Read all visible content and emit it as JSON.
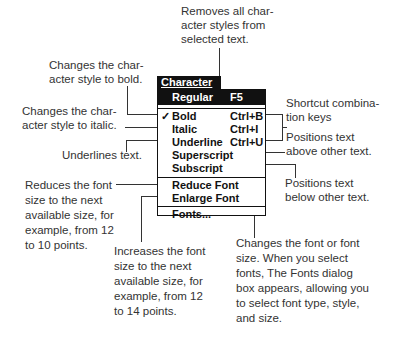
{
  "menu": {
    "title": "Character",
    "title_mnemonic": "C",
    "selected": {
      "label": "Regular",
      "shortcut": "F5"
    },
    "items": [
      {
        "label": "Bold",
        "mnemonic": "B",
        "shortcut": "Ctrl+B",
        "checked": true
      },
      {
        "label": "Italic",
        "mnemonic": "I",
        "shortcut": "Ctrl+I",
        "checked": false
      },
      {
        "label": "Underline",
        "mnemonic": "U",
        "shortcut": "Ctrl+U",
        "checked": false
      },
      {
        "label": "Superscript",
        "mnemonic": "p",
        "shortcut": "",
        "checked": false
      },
      {
        "label": "Subscript",
        "mnemonic": "c",
        "shortcut": "",
        "checked": false
      },
      {
        "label": "Reduce Font",
        "mnemonic": "R",
        "shortcut": "",
        "checked": false
      },
      {
        "label": "Enlarge Font",
        "mnemonic": "E",
        "shortcut": "",
        "checked": false
      },
      {
        "label": "Fonts...",
        "mnemonic": "F",
        "shortcut": "",
        "checked": false
      }
    ],
    "check_glyph": "✓"
  },
  "callouts": {
    "regular": "Removes all char-\nacter styles from\nselected text.",
    "bold": "Changes the char-\nacter style to bold.",
    "italic": "Changes the char-\nacter style to italic.",
    "underline": "Underlines text.",
    "shortcut": "Shortcut combina-\ntion keys",
    "superscript": "Positions text\nabove other text.",
    "subscript": "Positions text\nbelow other text.",
    "reduce": "Reduces the font\nsize to the next\navailable size, for\nexample, from 12\nto 10 points.",
    "enlarge": "Increases the font\nsize to the next\navailable size, for\nexample, from 12\nto 14 points.",
    "fonts": "Changes the font or font\nsize. When you select\nfonts, The Fonts dialog\nbox appears, allowing you\nto select font type, style,\nand size."
  }
}
